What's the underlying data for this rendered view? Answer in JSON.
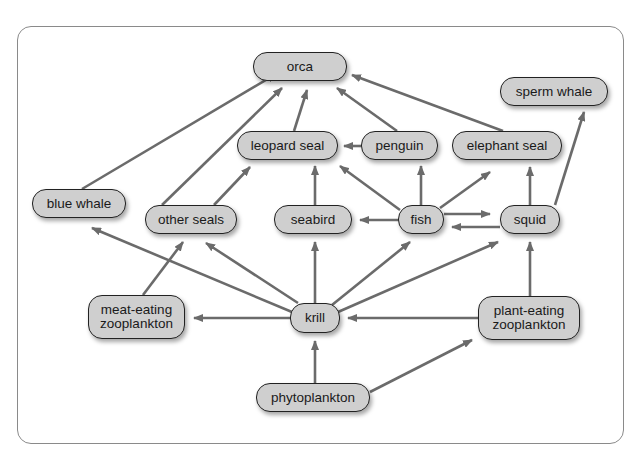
{
  "diagram": {
    "type": "food-web",
    "colors": {
      "node_fill": "#cfcfcf",
      "node_border": "#222222",
      "arrow": "#6b6b6b",
      "frame_border": "#8a8a8a",
      "background": "#ffffff"
    },
    "nodes": [
      {
        "id": "orca",
        "label": "orca",
        "x": 253,
        "y": 52,
        "w": 94,
        "h": 29
      },
      {
        "id": "sperm_whale",
        "label": "sperm whale",
        "x": 500,
        "y": 77,
        "w": 108,
        "h": 29
      },
      {
        "id": "leopard_seal",
        "label": "leopard seal",
        "x": 237,
        "y": 131,
        "w": 101,
        "h": 29
      },
      {
        "id": "penguin",
        "label": "penguin",
        "x": 361,
        "y": 131,
        "w": 77,
        "h": 29
      },
      {
        "id": "elephant_seal",
        "label": "elephant seal",
        "x": 452,
        "y": 131,
        "w": 110,
        "h": 29
      },
      {
        "id": "blue_whale",
        "label": "blue whale",
        "x": 32,
        "y": 189,
        "w": 94,
        "h": 29
      },
      {
        "id": "other_seals",
        "label": "other seals",
        "x": 145,
        "y": 205,
        "w": 92,
        "h": 29
      },
      {
        "id": "seabird",
        "label": "seabird",
        "x": 274,
        "y": 205,
        "w": 78,
        "h": 29
      },
      {
        "id": "fish",
        "label": "fish",
        "x": 398,
        "y": 205,
        "w": 46,
        "h": 29
      },
      {
        "id": "squid",
        "label": "squid",
        "x": 500,
        "y": 205,
        "w": 60,
        "h": 29
      },
      {
        "id": "meat_zoo",
        "label": "meat-eating\nzooplankton",
        "x": 88,
        "y": 295,
        "w": 97,
        "h": 44
      },
      {
        "id": "krill",
        "label": "krill",
        "x": 290,
        "y": 303,
        "w": 50,
        "h": 30
      },
      {
        "id": "plant_zoo",
        "label": "plant-eating\nzooplankton",
        "x": 478,
        "y": 296,
        "w": 102,
        "h": 44
      },
      {
        "id": "phytoplankton",
        "label": "phytoplankton",
        "x": 256,
        "y": 383,
        "w": 114,
        "h": 29
      }
    ],
    "edges": [
      {
        "from": "blue_whale",
        "to": "orca",
        "x1": 82,
        "y1": 189,
        "x2": 276,
        "y2": 74
      },
      {
        "from": "other_seals",
        "to": "orca",
        "x1": 162,
        "y1": 205,
        "x2": 282,
        "y2": 88
      },
      {
        "from": "leopard_seal",
        "to": "orca",
        "x1": 294,
        "y1": 131,
        "x2": 307,
        "y2": 90
      },
      {
        "from": "penguin",
        "to": "orca",
        "x1": 397,
        "y1": 131,
        "x2": 337,
        "y2": 88
      },
      {
        "from": "elephant_seal",
        "to": "orca",
        "x1": 503,
        "y1": 131,
        "x2": 352,
        "y2": 75
      },
      {
        "from": "squid",
        "to": "sperm_whale",
        "x1": 555,
        "y1": 205,
        "x2": 584,
        "y2": 112
      },
      {
        "from": "penguin",
        "to": "leopard_seal",
        "x1": 361,
        "y1": 146,
        "x2": 344,
        "y2": 146
      },
      {
        "from": "other_seals",
        "to": "leopard_seal",
        "x1": 214,
        "y1": 205,
        "x2": 250,
        "y2": 167
      },
      {
        "from": "seabird",
        "to": "leopard_seal",
        "x1": 315,
        "y1": 205,
        "x2": 315,
        "y2": 166
      },
      {
        "from": "fish",
        "to": "leopard_seal",
        "x1": 400,
        "y1": 210,
        "x2": 340,
        "y2": 166
      },
      {
        "from": "fish",
        "to": "penguin",
        "x1": 421,
        "y1": 205,
        "x2": 421,
        "y2": 166
      },
      {
        "from": "fish",
        "to": "elephant_seal",
        "x1": 440,
        "y1": 208,
        "x2": 490,
        "y2": 172
      },
      {
        "from": "squid",
        "to": "elephant_seal",
        "x1": 530,
        "y1": 205,
        "x2": 530,
        "y2": 167
      },
      {
        "from": "fish",
        "to": "seabird",
        "x1": 398,
        "y1": 220,
        "x2": 360,
        "y2": 220
      },
      {
        "from": "fish",
        "to": "squid",
        "x1": 444,
        "y1": 214,
        "x2": 490,
        "y2": 214
      },
      {
        "from": "squid",
        "to": "fish",
        "x1": 500,
        "y1": 227,
        "x2": 452,
        "y2": 227
      },
      {
        "from": "krill",
        "to": "blue_whale",
        "x1": 292,
        "y1": 312,
        "x2": 92,
        "y2": 228
      },
      {
        "from": "meat_zoo",
        "to": "other_seals",
        "x1": 143,
        "y1": 295,
        "x2": 183,
        "y2": 242
      },
      {
        "from": "krill",
        "to": "other_seals",
        "x1": 298,
        "y1": 303,
        "x2": 206,
        "y2": 243
      },
      {
        "from": "krill",
        "to": "seabird",
        "x1": 315,
        "y1": 303,
        "x2": 315,
        "y2": 242
      },
      {
        "from": "krill",
        "to": "fish",
        "x1": 332,
        "y1": 305,
        "x2": 410,
        "y2": 242
      },
      {
        "from": "krill",
        "to": "squid",
        "x1": 338,
        "y1": 312,
        "x2": 498,
        "y2": 242
      },
      {
        "from": "krill",
        "to": "meat_zoo",
        "x1": 290,
        "y1": 318,
        "x2": 194,
        "y2": 318
      },
      {
        "from": "plant_zoo",
        "to": "krill",
        "x1": 478,
        "y1": 318,
        "x2": 348,
        "y2": 318
      },
      {
        "from": "plant_zoo",
        "to": "squid",
        "x1": 530,
        "y1": 296,
        "x2": 530,
        "y2": 242
      },
      {
        "from": "phytoplankton",
        "to": "krill",
        "x1": 315,
        "y1": 383,
        "x2": 315,
        "y2": 341
      },
      {
        "from": "phytoplankton",
        "to": "plant_zoo",
        "x1": 370,
        "y1": 392,
        "x2": 472,
        "y2": 340
      }
    ]
  }
}
